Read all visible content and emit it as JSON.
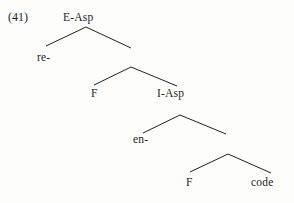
{
  "example": {
    "number": "(41)"
  },
  "diagram": {
    "type": "syntactic-tree",
    "ink_color": "#231f20",
    "background_color": "#fdfdfc",
    "nodes": [
      {
        "id": "root",
        "label": "E-Asp",
        "x": 86,
        "y": 18
      },
      {
        "id": "re",
        "label": "re-",
        "x": 46,
        "y": 57
      },
      {
        "id": "mid1",
        "label": "",
        "x": 131,
        "y": 67
      },
      {
        "id": "f1",
        "label": "F",
        "x": 95,
        "y": 93
      },
      {
        "id": "i-asp",
        "label": "I-Asp",
        "x": 175,
        "y": 93
      },
      {
        "id": "mid2",
        "label": "",
        "x": 180,
        "y": 115
      },
      {
        "id": "en",
        "label": "en-",
        "x": 143,
        "y": 139
      },
      {
        "id": "mid3",
        "label": "",
        "x": 228,
        "y": 154
      },
      {
        "id": "f2",
        "label": "F",
        "x": 190,
        "y": 182
      },
      {
        "id": "code",
        "label": "code",
        "x": 265,
        "y": 182
      }
    ],
    "branches": [
      {
        "name": "root-left",
        "x1": 86,
        "y1": 27,
        "x2": 46,
        "y2": 46
      },
      {
        "name": "root-right",
        "x1": 86,
        "y1": 27,
        "x2": 131,
        "y2": 48
      },
      {
        "name": "mid1-left",
        "x1": 131,
        "y1": 67,
        "x2": 94,
        "y2": 85
      },
      {
        "name": "mid1-right",
        "x1": 131,
        "y1": 67,
        "x2": 177,
        "y2": 86
      },
      {
        "name": "mid2-left",
        "x1": 180,
        "y1": 115,
        "x2": 143,
        "y2": 133
      },
      {
        "name": "mid2-right",
        "x1": 180,
        "y1": 115,
        "x2": 226,
        "y2": 134
      },
      {
        "name": "mid3-left",
        "x1": 228,
        "y1": 154,
        "x2": 190,
        "y2": 172
      },
      {
        "name": "mid3-right",
        "x1": 228,
        "y1": 154,
        "x2": 271,
        "y2": 173
      }
    ]
  }
}
